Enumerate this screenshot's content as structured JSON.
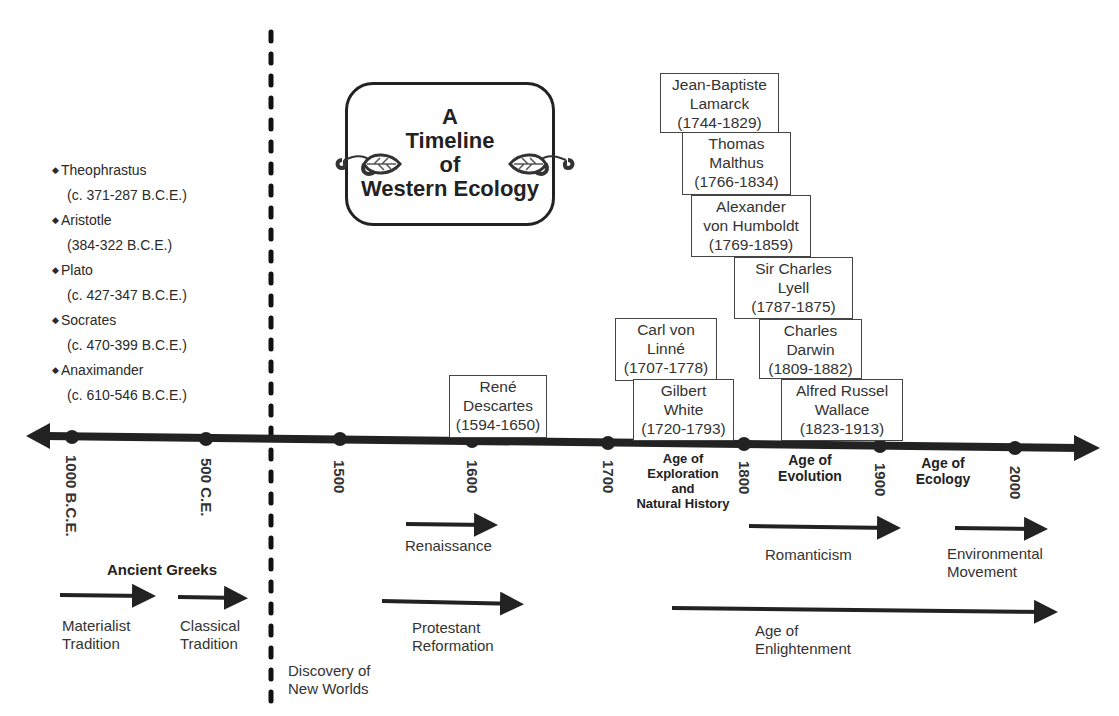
{
  "title": {
    "line1": "A",
    "line2": "Timeline",
    "line3": "of",
    "line4": "Western Ecology"
  },
  "ancient_greeks": {
    "heading": "Ancient Greeks",
    "philosophers": [
      {
        "name": "Theophrastus",
        "dates": "(c. 371-287 B.C.E.)"
      },
      {
        "name": "Aristotle",
        "dates": "(384-322 B.C.E.)"
      },
      {
        "name": "Plato",
        "dates": "(c. 427-347 B.C.E.)"
      },
      {
        "name": "Socrates",
        "dates": "(c. 470-399 B.C.E.)"
      },
      {
        "name": "Anaximander",
        "dates": "(c. 610-546 B.C.E.)"
      }
    ]
  },
  "axis": {
    "ticks": [
      "1000 B.C.E.",
      "500 C.E.",
      "1500",
      "1600",
      "1700",
      "1800",
      "1900",
      "2000"
    ]
  },
  "eras": [
    {
      "label": "Age of Exploration and Natural History",
      "lines": [
        "Age of",
        "Exploration",
        "and",
        "Natural History"
      ]
    },
    {
      "label": "Age of Evolution",
      "lines": [
        "Age of",
        "Evolution"
      ]
    },
    {
      "label": "Age of Ecology",
      "lines": [
        "Age of",
        "Ecology"
      ]
    }
  ],
  "people": [
    {
      "lines": [
        "René",
        "Descartes",
        "(1594-1650)"
      ]
    },
    {
      "lines": [
        "Carl von",
        "Linné",
        "(1707-1778)"
      ]
    },
    {
      "lines": [
        "Gilbert",
        "White",
        "(1720-1793)"
      ]
    },
    {
      "lines": [
        "Jean-Baptiste",
        "Lamarck",
        "(1744-1829)"
      ]
    },
    {
      "lines": [
        "Thomas",
        "Malthus",
        "(1766-1834)"
      ]
    },
    {
      "lines": [
        "Alexander",
        "von Humboldt",
        "(1769-1859)"
      ]
    },
    {
      "lines": [
        "Sir Charles",
        "Lyell",
        "(1787-1875)"
      ]
    },
    {
      "lines": [
        "Charles",
        "Darwin",
        "(1809-1882)"
      ]
    },
    {
      "lines": [
        "Alfred Russel",
        "Wallace",
        "(1823-1913)"
      ]
    }
  ],
  "movements": [
    {
      "lines": [
        "Materialist",
        "Tradition"
      ]
    },
    {
      "lines": [
        "Classical",
        "Tradition"
      ]
    },
    {
      "lines": [
        "Discovery of",
        "New Worlds"
      ]
    },
    {
      "lines": [
        "Renaissance"
      ]
    },
    {
      "lines": [
        "Protestant",
        "Reformation"
      ]
    },
    {
      "lines": [
        "Romanticism"
      ]
    },
    {
      "lines": [
        "Environmental",
        "Movement"
      ]
    },
    {
      "lines": [
        "Age of",
        "Enlightenment"
      ]
    }
  ],
  "colors": {
    "ink": "#222222",
    "text": "#333333",
    "background": "#ffffff"
  }
}
